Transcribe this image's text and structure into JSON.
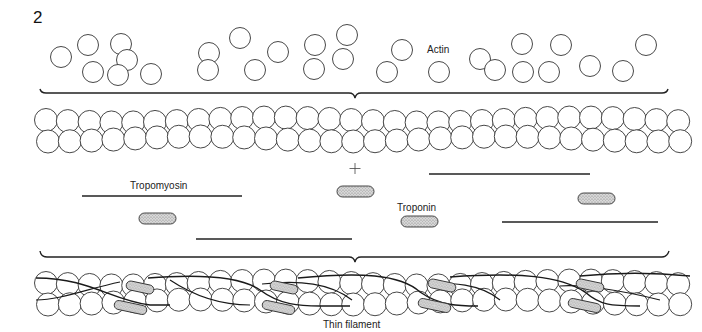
{
  "figure": {
    "number": "2",
    "labels": {
      "actin": "Actin",
      "tropomyosin": "Tropomyosin",
      "troponin": "Troponin",
      "plus": "+",
      "thin_filament": "Thin filament"
    },
    "colors": {
      "line": "#222222",
      "circle_stroke": "#333333",
      "troponin_fill": "#c8c8c8",
      "background": "#ffffff"
    },
    "free_actin": [
      [
        61,
        57
      ],
      [
        88,
        45
      ],
      [
        93,
        72
      ],
      [
        121,
        44
      ],
      [
        127,
        60
      ],
      [
        118,
        75
      ],
      [
        151,
        74
      ],
      [
        209,
        53
      ],
      [
        208,
        70
      ],
      [
        240,
        38
      ],
      [
        255,
        70
      ],
      [
        278,
        52
      ],
      [
        315,
        45
      ],
      [
        314,
        69
      ],
      [
        347,
        35
      ],
      [
        343,
        59
      ],
      [
        387,
        72
      ],
      [
        402,
        50
      ],
      [
        439,
        72
      ],
      [
        480,
        59
      ],
      [
        495,
        70
      ],
      [
        522,
        44
      ],
      [
        523,
        72
      ],
      [
        549,
        72
      ],
      [
        561,
        45
      ],
      [
        590,
        66
      ],
      [
        623,
        71
      ],
      [
        646,
        45
      ]
    ],
    "tropomyosin_lines": [
      {
        "x1": 82,
        "x2": 242,
        "y": 196
      },
      {
        "x1": 196,
        "x2": 352,
        "y": 239
      },
      {
        "x1": 429,
        "x2": 590,
        "y": 174
      },
      {
        "x1": 502,
        "x2": 658,
        "y": 222
      }
    ],
    "troponin_pills": [
      {
        "x": 139,
        "y": 213,
        "w": 37,
        "h": 11
      },
      {
        "x": 337,
        "y": 186,
        "w": 37,
        "h": 11
      },
      {
        "x": 401,
        "y": 216,
        "w": 37,
        "h": 11
      },
      {
        "x": 578,
        "y": 193,
        "w": 37,
        "h": 11
      }
    ]
  }
}
